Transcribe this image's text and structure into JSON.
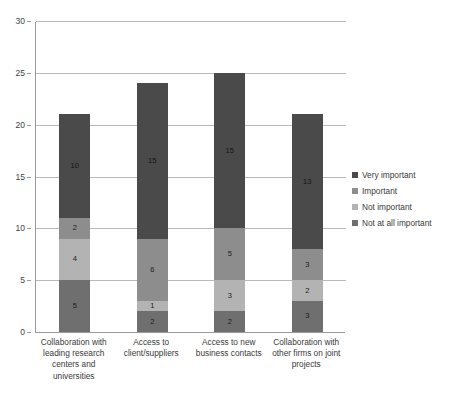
{
  "chart_data": {
    "type": "bar",
    "subtype": "stacked-column",
    "title": "",
    "xlabel": "",
    "ylabel": "",
    "ylim": [
      0,
      30
    ],
    "yticks": [
      0,
      5,
      10,
      15,
      20,
      25,
      30
    ],
    "grid": true,
    "legend_position": "right",
    "categories": [
      "Collaboration with leading research centers and universities",
      "Access to client/suppliers",
      "Access to new business contacts",
      "Collaboration with other firms on joint projects"
    ],
    "category_lines": [
      [
        "Collaboration with",
        "leading research",
        "centers and",
        "universities"
      ],
      [
        "Access to",
        "client/suppliers"
      ],
      [
        "Access to new",
        "business contacts"
      ],
      [
        "Collaboration with",
        "other firms on joint",
        "projects"
      ]
    ],
    "series": [
      {
        "name": "Not at all important",
        "color": "#6f6f6f",
        "values": [
          5,
          2,
          2,
          3
        ]
      },
      {
        "name": "Not important",
        "color": "#b3b3b3",
        "values": [
          4,
          1,
          3,
          2
        ]
      },
      {
        "name": "Important",
        "color": "#8d8d8d",
        "values": [
          2,
          6,
          5,
          3
        ]
      },
      {
        "name": "Very important",
        "color": "#4a4a4a",
        "values": [
          10,
          15,
          15,
          13
        ]
      }
    ],
    "stack_order_bottom_to_top": [
      "Not at all important",
      "Not important",
      "Important",
      "Very important"
    ],
    "totals": [
      21,
      24,
      25,
      21
    ]
  },
  "legend": {
    "items": [
      {
        "label": "Very important",
        "color": "#4a4a4a"
      },
      {
        "label": "Important",
        "color": "#8d8d8d"
      },
      {
        "label": "Not important",
        "color": "#b3b3b3"
      },
      {
        "label": "Not at all important",
        "color": "#6f6f6f"
      }
    ]
  },
  "axis": {
    "y_tick_labels": [
      "30",
      "25",
      "20",
      "15",
      "10",
      "5",
      "0"
    ]
  }
}
